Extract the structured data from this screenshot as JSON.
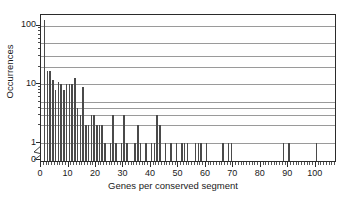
{
  "chart_data": {
    "type": "bar",
    "title": "",
    "xlabel": "Genes per conserved segment",
    "ylabel": "Occurrences",
    "yscale": "log",
    "y_axis_broken_at_zero": true,
    "ylim": [
      1,
      130
    ],
    "xlim": [
      0,
      107
    ],
    "grid": true,
    "grid_values": [
      1,
      2,
      3,
      4,
      5,
      10,
      20,
      30,
      50,
      100
    ],
    "ytick_labels": [
      "0",
      "1",
      "10",
      "100"
    ],
    "ytick_values": [
      0,
      1,
      10,
      100
    ],
    "xtick_labels": [
      "0",
      "10",
      "20",
      "30",
      "40",
      "50",
      "60",
      "70",
      "80",
      "90",
      "100"
    ],
    "xtick_values": [
      0,
      10,
      20,
      30,
      40,
      50,
      60,
      70,
      80,
      90,
      100
    ],
    "legend": null,
    "bar_color": "#4a4a4a",
    "x": [
      1,
      2,
      3,
      4,
      5,
      6,
      7,
      8,
      9,
      10,
      11,
      12,
      13,
      14,
      15,
      16,
      17,
      18,
      19,
      20,
      21,
      22,
      23,
      25,
      26,
      27,
      29,
      30,
      31,
      34,
      35,
      36,
      38,
      40,
      41,
      42,
      43,
      45,
      47,
      49,
      51,
      52,
      53,
      56,
      57,
      58,
      60,
      66,
      68,
      69,
      88,
      90,
      100,
      107
    ],
    "values": [
      124,
      17,
      17,
      12,
      8,
      11,
      10,
      8,
      10,
      10,
      10,
      13,
      4,
      3,
      9,
      2,
      2,
      3,
      3,
      2,
      2,
      2,
      1,
      1,
      3,
      1,
      1,
      3,
      1,
      1,
      2,
      1,
      1,
      1,
      1,
      3,
      2,
      1,
      1,
      1,
      1,
      1,
      1,
      1,
      1,
      1,
      1,
      1,
      1,
      1,
      1,
      1,
      1,
      1
    ]
  }
}
